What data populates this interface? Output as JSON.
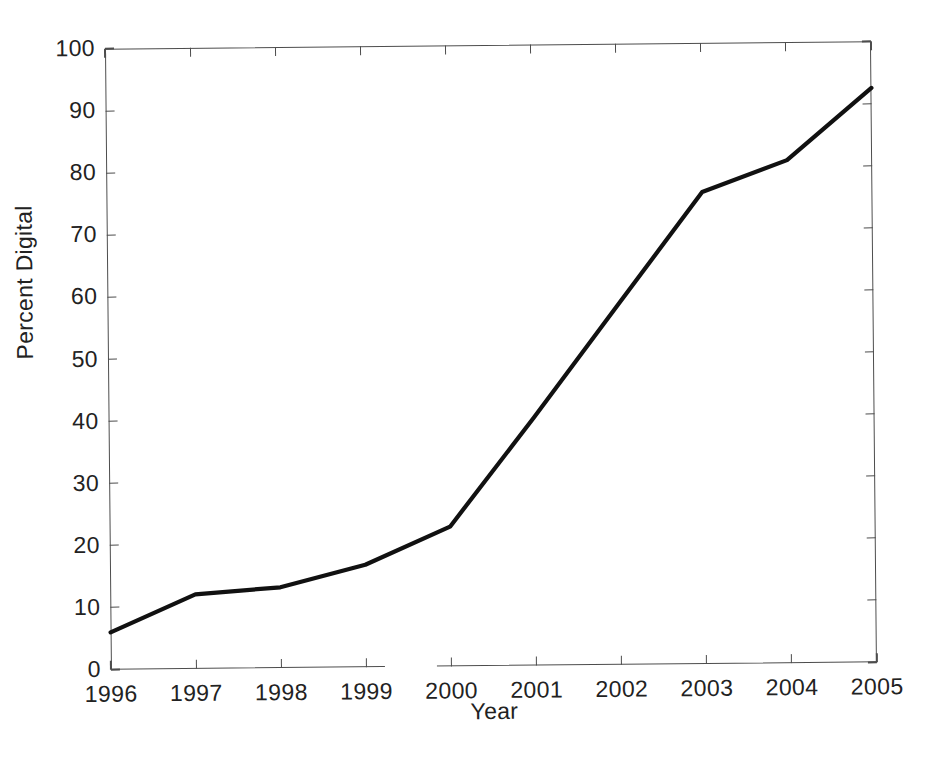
{
  "chart_data": {
    "type": "line",
    "title": "",
    "xlabel": "Year",
    "ylabel": "Percent Digital",
    "x": [
      1996,
      1997,
      1998,
      1999,
      2000,
      2001,
      2002,
      2003,
      2004,
      2005
    ],
    "categories": [
      "1996",
      "1997",
      "1998",
      "1999",
      "2000",
      "2001",
      "2002",
      "2003",
      "2004",
      "2005"
    ],
    "values": [
      6,
      12,
      13,
      16.5,
      22.5,
      40,
      58,
      76,
      81,
      92.5
    ],
    "series": [
      {
        "name": "Percent Digital",
        "values": [
          6,
          12,
          13,
          16.5,
          22.5,
          40,
          58,
          76,
          81,
          92.5
        ],
        "color": "#111111",
        "line_width": 4,
        "marker": "none"
      }
    ],
    "xlim": [
      1996,
      2005
    ],
    "ylim": [
      0,
      100
    ],
    "xticks": [
      1996,
      1997,
      1998,
      1999,
      2000,
      2001,
      2002,
      2003,
      2004,
      2005
    ],
    "yticks": [
      0,
      10,
      20,
      30,
      40,
      50,
      60,
      70,
      80,
      90,
      100
    ],
    "xtick_labels": [
      "1996",
      "1997",
      "1998",
      "1999",
      "2000",
      "2001",
      "2002",
      "2003",
      "2004",
      "2005"
    ],
    "ytick_labels": [
      "0",
      "10",
      "20",
      "30",
      "40",
      "50",
      "60",
      "70",
      "80",
      "90",
      "100"
    ],
    "grid": false,
    "legend": false,
    "legend_position": "none",
    "axis_style": "box",
    "tick_direction": "in",
    "background_color": "#ffffff",
    "axis_color": "#4d4d4d",
    "text_color": "#222222",
    "annotations": []
  }
}
